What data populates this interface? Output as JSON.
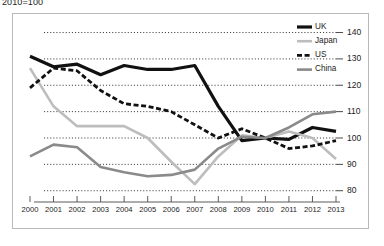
{
  "subtitle": "2010=100",
  "chart_data": {
    "type": "line",
    "title": "",
    "subtitle": "2010=100",
    "xlabel": "",
    "ylabel": "",
    "x": [
      2000,
      2001,
      2002,
      2003,
      2004,
      2005,
      2006,
      2007,
      2008,
      2009,
      2010,
      2011,
      2012,
      2013
    ],
    "categories": [
      "2000",
      "2001",
      "2002",
      "2003",
      "2004",
      "2005",
      "2006",
      "2007",
      "2008",
      "2009",
      "2010",
      "2011",
      "2012",
      "2013"
    ],
    "ylim": [
      78,
      144
    ],
    "yticks": [
      80,
      90,
      100,
      110,
      120,
      130,
      140
    ],
    "ytick_labels": [
      "80",
      "90",
      "100",
      "110",
      "120",
      "130",
      "140"
    ],
    "y_axis_position": "right",
    "grid": "horizontal-dotted",
    "legend_position": "top-right",
    "series": [
      {
        "name": "UK",
        "color": "#111111",
        "style": "solid",
        "width": 3.2,
        "values": [
          131,
          127,
          128,
          124,
          127.5,
          126,
          126,
          127.5,
          112,
          99,
          100,
          99.5,
          104,
          102.5
        ]
      },
      {
        "name": "Japan",
        "color": "#bdbdbd",
        "style": "solid",
        "width": 2.6,
        "values": [
          126.5,
          112,
          104.5,
          104.5,
          104.5,
          100,
          91,
          82.5,
          93,
          101,
          100,
          102.5,
          100,
          92
        ]
      },
      {
        "name": "US",
        "color": "#111111",
        "style": "dashed",
        "width": 2.8,
        "values": [
          119,
          126.5,
          125.5,
          118,
          113,
          112,
          110,
          105,
          100,
          103.5,
          100,
          96,
          97,
          99
        ]
      },
      {
        "name": "China",
        "color": "#8a8a8a",
        "style": "solid",
        "width": 2.6,
        "values": [
          93,
          97.5,
          96.5,
          89,
          87,
          85.5,
          86,
          88,
          96,
          100.5,
          100,
          104,
          109,
          110
        ]
      }
    ]
  },
  "legend": {
    "items": [
      {
        "label": "UK"
      },
      {
        "label": "Japan"
      },
      {
        "label": "US"
      },
      {
        "label": "China"
      }
    ]
  }
}
